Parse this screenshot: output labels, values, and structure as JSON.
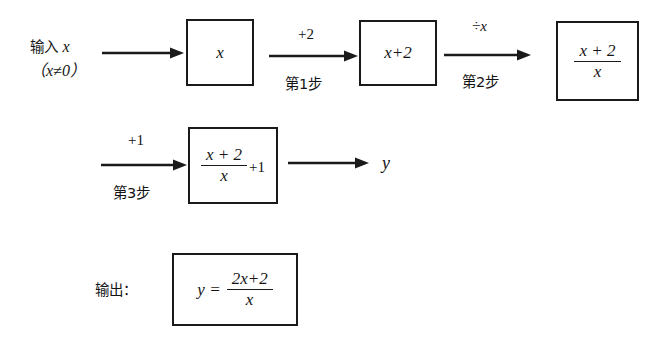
{
  "diagram": {
    "colors": {
      "ink": "#141414",
      "box_border": "#1a1a1a",
      "background": "#ffffff"
    },
    "input": {
      "label_line1_text": "输入",
      "label_line1_var": "x",
      "label_line2": "（x≠0）"
    },
    "output": {
      "label": "输出："
    },
    "boxes": [
      {
        "id": "box-x",
        "content": "x"
      },
      {
        "id": "box-x-plus-2",
        "content": "x+2"
      },
      {
        "id": "box-frac",
        "numerator": "x + 2",
        "denominator": "x"
      },
      {
        "id": "box-frac-plus-1",
        "numerator": "x + 2",
        "denominator": "x",
        "tail": "+1"
      },
      {
        "id": "box-result",
        "lhs": "y =",
        "numerator": "2x+2",
        "denominator": "x"
      }
    ],
    "arrows": [
      {
        "id": "arrow-input",
        "top_label": "",
        "bottom_label": ""
      },
      {
        "id": "arrow-step-1",
        "top_label": "+2",
        "bottom_label": "第1步"
      },
      {
        "id": "arrow-step-2",
        "top_label": "÷x",
        "bottom_label": "第2步"
      },
      {
        "id": "arrow-step-3",
        "top_label": "+1",
        "bottom_label": "第3步"
      },
      {
        "id": "arrow-output",
        "top_label": "",
        "bottom_label": ""
      }
    ],
    "result_variable": "y"
  }
}
